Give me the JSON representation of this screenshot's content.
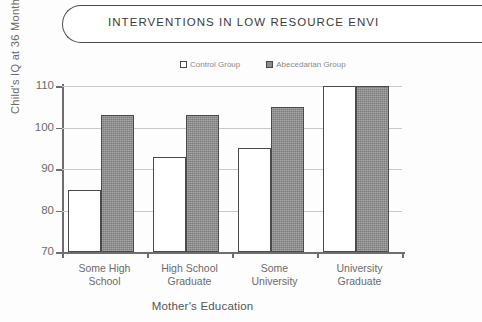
{
  "header": {
    "title": "INTERVENTIONS IN LOW RESOURCE ENVI"
  },
  "legend": {
    "position": "top-center",
    "entries": [
      {
        "label": "Control Group",
        "marker": "hollow-square",
        "color": "#ffffff"
      },
      {
        "label": "Abecedarian Group",
        "marker": "filled-square",
        "color": "#8d8d8d"
      }
    ]
  },
  "chart_data": {
    "type": "bar",
    "title": "",
    "xlabel": "Mother's Education",
    "ylabel": "Child's IQ at 36 Months",
    "categories": [
      "Some High School",
      "High School Graduate",
      "Some University",
      "University Graduate"
    ],
    "category_lines": [
      [
        "Some High",
        "School"
      ],
      [
        "High School",
        "Graduate"
      ],
      [
        "Some",
        "University"
      ],
      [
        "University",
        "Graduate"
      ]
    ],
    "series": [
      {
        "name": "Control Group",
        "values": [
          85,
          93,
          95,
          110
        ],
        "color": "#ffffff"
      },
      {
        "name": "Abecedarian Group",
        "values": [
          103,
          103,
          105,
          110
        ],
        "color": "#8d8d8d"
      }
    ],
    "ylim": [
      70,
      110
    ],
    "yticks": [
      70,
      80,
      90,
      100,
      110
    ],
    "ytick_labels": [
      "70",
      "80",
      "90",
      "100",
      "110"
    ],
    "grid": true,
    "legend_position": "top-center"
  }
}
